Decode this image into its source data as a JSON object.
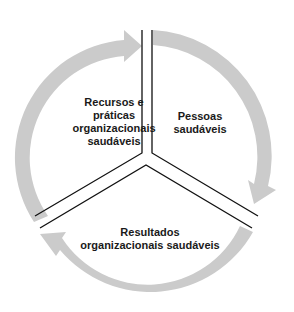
{
  "diagram": {
    "type": "cycle",
    "colors": {
      "arc": "#cbcbcb",
      "divider": "#111111",
      "text": "#1a1a1a",
      "background": "#ffffff"
    },
    "segments": [
      {
        "id": "left",
        "label_lines": [
          "Recursos e",
          "práticas",
          "organizacionais",
          "saudáveis"
        ]
      },
      {
        "id": "right",
        "label_lines": [
          "Pessoas",
          "saudáveis"
        ]
      },
      {
        "id": "bottom",
        "label_lines": [
          "Resultados",
          "organizacionais saudáveis"
        ]
      }
    ],
    "arrows": [
      {
        "from": "left",
        "to": "right",
        "direction": "clockwise"
      },
      {
        "from": "right",
        "to": "bottom",
        "direction": "clockwise"
      },
      {
        "from": "bottom",
        "to": "left",
        "direction": "clockwise"
      }
    ]
  }
}
